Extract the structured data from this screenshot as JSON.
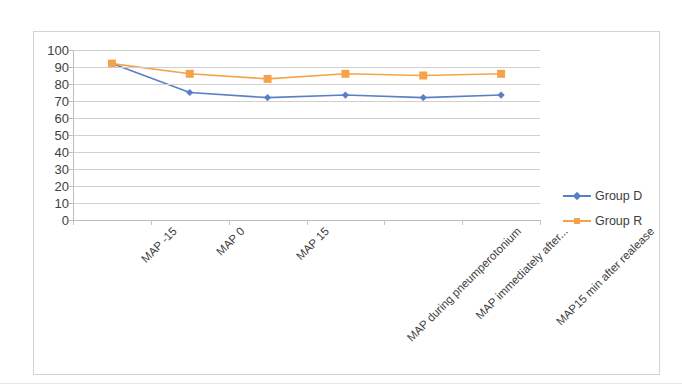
{
  "chart_data": {
    "type": "line",
    "title": "",
    "subtitle": "",
    "xlabel": "",
    "ylabel": "",
    "ylim": [
      0,
      100
    ],
    "ytick_step": 10,
    "yticks": [
      100,
      90,
      80,
      70,
      60,
      50,
      40,
      30,
      20,
      10,
      0
    ],
    "grid": true,
    "legend_position": "right",
    "categories": [
      "MAP -15",
      "MAP 0",
      "MAP 15",
      "MAP during pneumperotonium",
      "MAP immediately after...",
      "MAP15 min after realease"
    ],
    "series": [
      {
        "name": "Group D",
        "color": "#5B7FC7",
        "marker": "diamond",
        "values": [
          92,
          75,
          72,
          73.5,
          72,
          73.5
        ]
      },
      {
        "name": "Group R",
        "color": "#F5A34A",
        "marker": "square",
        "values": [
          92,
          86,
          83,
          86,
          85,
          86
        ]
      }
    ]
  },
  "legend": {
    "items": [
      {
        "label": "Group D",
        "color": "#5B7FC7",
        "marker": "diamond"
      },
      {
        "label": "Group R",
        "color": "#F5A34A",
        "marker": "square"
      }
    ]
  },
  "axes": {
    "y_tick_labels": [
      "100",
      "90",
      "80",
      "70",
      "60",
      "50",
      "40",
      "30",
      "20",
      "10",
      "0"
    ],
    "x_tick_labels": [
      "MAP -15",
      "MAP 0",
      "MAP 15",
      "MAP during pneumperotonium",
      "MAP immediately after...",
      "MAP15 min after realease"
    ]
  },
  "colors": {
    "group_d": "#5B7FC7",
    "group_r": "#F5A34A",
    "gridline": "#cfcfcf",
    "axis": "#bdbdbd",
    "frame": "#d4d4d4",
    "text": "#3d3d3d",
    "background": "#ffffff"
  }
}
